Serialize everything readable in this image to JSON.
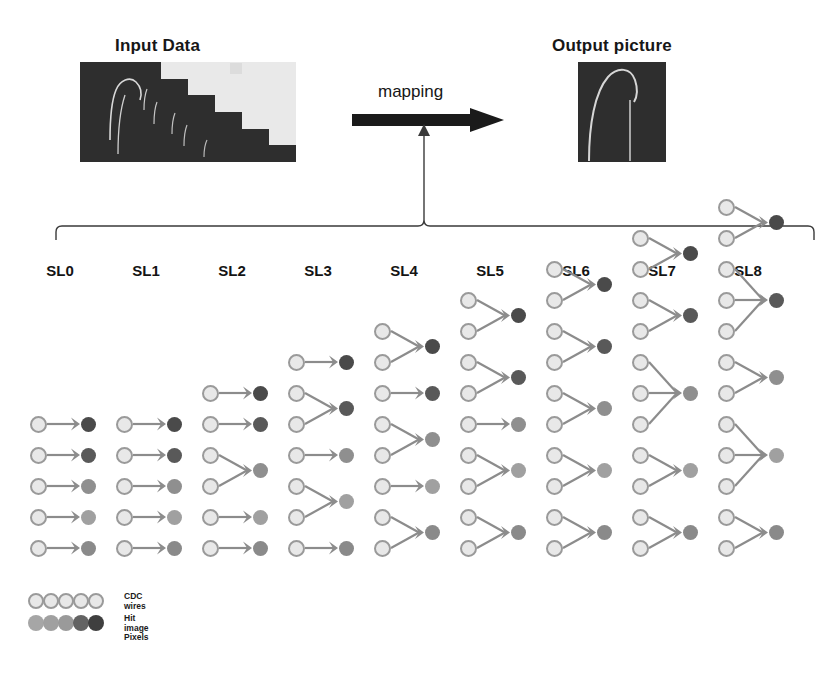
{
  "headings": {
    "input": "Input Data",
    "output": "Output picture"
  },
  "mapping": {
    "label": "mapping",
    "arrow_icon": "right-arrow-icon"
  },
  "superlayers": {
    "labels": [
      "SL0",
      "SL1",
      "SL2",
      "SL3",
      "SL4",
      "SL5",
      "SL6",
      "SL7",
      "SL8"
    ],
    "columns": [
      {
        "label": "SL0",
        "wire_count": 5,
        "pixel_count": 5,
        "groups": [
          1,
          1,
          1,
          1,
          1
        ]
      },
      {
        "label": "SL1",
        "wire_count": 5,
        "pixel_count": 5,
        "groups": [
          1,
          1,
          1,
          1,
          1
        ]
      },
      {
        "label": "SL2",
        "wire_count": 6,
        "pixel_count": 5,
        "groups": [
          1,
          1,
          2,
          1,
          1
        ]
      },
      {
        "label": "SL3",
        "wire_count": 7,
        "pixel_count": 5,
        "groups": [
          1,
          2,
          1,
          2,
          1
        ]
      },
      {
        "label": "SL4",
        "wire_count": 8,
        "pixel_count": 5,
        "groups": [
          2,
          1,
          2,
          1,
          2
        ]
      },
      {
        "label": "SL5",
        "wire_count": 9,
        "pixel_count": 5,
        "groups": [
          2,
          2,
          1,
          2,
          2
        ]
      },
      {
        "label": "SL6",
        "wire_count": 10,
        "pixel_count": 5,
        "groups": [
          2,
          2,
          2,
          2,
          2
        ]
      },
      {
        "label": "SL7",
        "wire_count": 11,
        "pixel_count": 5,
        "groups": [
          2,
          2,
          3,
          2,
          2
        ]
      },
      {
        "label": "SL8",
        "wire_count": 12,
        "pixel_count": 5,
        "groups": [
          2,
          3,
          2,
          3,
          2
        ]
      }
    ]
  },
  "pixel_colors": [
    "#4a4a4a",
    "#595959",
    "#8f8f8f",
    "#a0a0a0",
    "#8a8a8a"
  ],
  "wire_color": "#e8e8e8",
  "wire_border_color": "#9a9a9a",
  "arrow_color": "#8c8c8c",
  "legend": {
    "rows": [
      {
        "name": "cdc-wires",
        "text_line1": "CDC",
        "text_line2": "wires",
        "colors": [
          "#e8e8e8",
          "#e8e8e8",
          "#e8e8e8",
          "#e8e8e8",
          "#e8e8e8"
        ],
        "type": "wire"
      },
      {
        "name": "hit-image-pixels",
        "text_line1": "Hit image",
        "text_line2": "Pixels",
        "colors": [
          "#a6a6a6",
          "#a0a0a0",
          "#9a9a9a",
          "#636363",
          "#3f3f3f"
        ],
        "type": "pixel"
      }
    ]
  },
  "chart_data": {
    "type": "diagram",
    "categories": [
      "SL0",
      "SL1",
      "SL2",
      "SL3",
      "SL4",
      "SL5",
      "SL6",
      "SL7",
      "SL8"
    ],
    "wires_per_superlayer": [
      5,
      5,
      6,
      7,
      8,
      9,
      10,
      11,
      12
    ],
    "pixels_per_superlayer": [
      5,
      5,
      5,
      5,
      5,
      5,
      5,
      5,
      5
    ]
  }
}
